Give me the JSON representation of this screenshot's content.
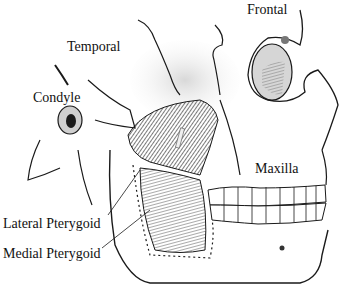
{
  "figure": {
    "labels": {
      "frontal": "Frontal",
      "temporal": "Temporal",
      "condyle": "Condyle",
      "maxilla": "Maxilla",
      "lateral_pterygoid": "Lateral Pterygoid",
      "medial_pterygoid": "Medial Pterygoid"
    },
    "colors": {
      "ink": "#1a1a1a",
      "muscle_dark": "#3a3a3a",
      "muscle_medium": "#6e6e6e",
      "bone_shade": "#bdbdbd",
      "background": "#ffffff"
    }
  }
}
